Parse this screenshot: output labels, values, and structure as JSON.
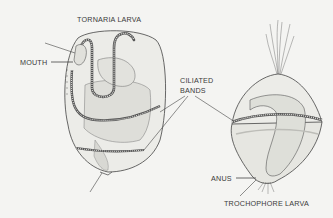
{
  "figure": {
    "title_left": "TORNARIA LARVA",
    "title_right": "TROCHOPHORE LARVA",
    "labels": {
      "mouth": "MOUTH",
      "ciliated_line1": "CILIATED",
      "ciliated_line2": "BANDS",
      "anus": "ANUS"
    },
    "colors": {
      "background": "#f4f4f2",
      "ink": "#3a3a3a",
      "shade": "#cfcfcb"
    }
  }
}
